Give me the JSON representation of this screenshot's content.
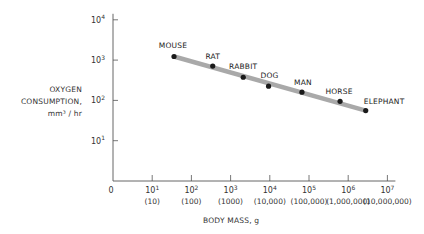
{
  "chart_data": {
    "type": "scatter",
    "title": "",
    "xlabel": "BODY MASS, g",
    "ylabel_lines": [
      "OXYGEN",
      "CONSUMPTION,",
      "mm³ / hr"
    ],
    "x_scale": "log",
    "y_scale": "log",
    "xlim_log10": [
      0,
      7
    ],
    "ylim_log10": [
      0,
      4
    ],
    "x_ticks": [
      {
        "exp": "1",
        "value": "(10)"
      },
      {
        "exp": "2",
        "value": "(100)"
      },
      {
        "exp": "3",
        "value": "(1000)"
      },
      {
        "exp": "4",
        "value": "(10,000)"
      },
      {
        "exp": "5",
        "value": "(100,000)"
      },
      {
        "exp": "6",
        "value": "(1,000,000)"
      },
      {
        "exp": "7",
        "value": "(10,000,000)"
      }
    ],
    "x_zero_label": "0",
    "y_ticks": [
      {
        "exp": "1"
      },
      {
        "exp": "2"
      },
      {
        "exp": "3"
      },
      {
        "exp": "4"
      }
    ],
    "tick_base": "10",
    "points": [
      {
        "label": "MOUSE",
        "x": 36,
        "y": 1230
      },
      {
        "label": "RAT",
        "x": 350,
        "y": 710
      },
      {
        "label": "RABBIT",
        "x": 2100,
        "y": 375
      },
      {
        "label": "DOG",
        "x": 9300,
        "y": 225
      },
      {
        "label": "MAN",
        "x": 66000,
        "y": 160
      },
      {
        "label": "HORSE",
        "x": 620000,
        "y": 95
      },
      {
        "label": "ELEPHANT",
        "x": 2800000,
        "y": 56
      }
    ],
    "trend_line": {
      "from": "MOUSE",
      "to": "ELEPHANT"
    },
    "grid": false,
    "legend": "none",
    "colors": {
      "trend": "#a9a9a9",
      "point": "#1a1a1a",
      "axis": "#555555"
    }
  }
}
